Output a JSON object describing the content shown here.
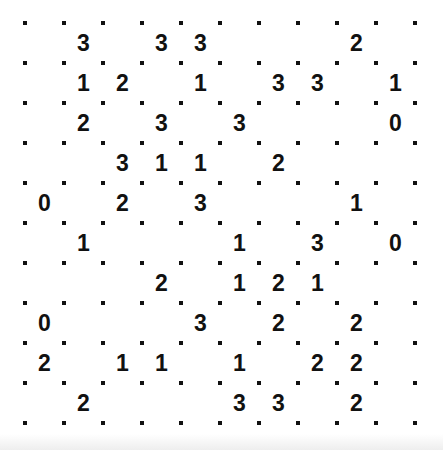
{
  "puzzle": {
    "type": "slitherlink",
    "rows": 10,
    "cols": 10,
    "clues": [
      [
        null,
        3,
        null,
        3,
        3,
        null,
        null,
        null,
        2,
        null
      ],
      [
        null,
        1,
        2,
        null,
        1,
        null,
        3,
        3,
        null,
        1
      ],
      [
        null,
        2,
        null,
        3,
        null,
        3,
        null,
        null,
        null,
        0
      ],
      [
        null,
        null,
        3,
        1,
        1,
        null,
        2,
        null,
        null,
        null
      ],
      [
        0,
        null,
        2,
        null,
        3,
        null,
        null,
        null,
        1,
        null
      ],
      [
        null,
        1,
        null,
        null,
        null,
        1,
        null,
        3,
        null,
        0
      ],
      [
        null,
        null,
        null,
        2,
        null,
        1,
        2,
        1,
        null,
        null
      ],
      [
        0,
        null,
        null,
        null,
        3,
        null,
        2,
        null,
        2,
        null
      ],
      [
        2,
        null,
        1,
        1,
        null,
        1,
        null,
        2,
        2,
        null
      ],
      [
        null,
        2,
        null,
        null,
        null,
        3,
        3,
        null,
        2,
        null
      ]
    ]
  },
  "colors": {
    "background": "#ffffff",
    "ink": "#111111"
  }
}
